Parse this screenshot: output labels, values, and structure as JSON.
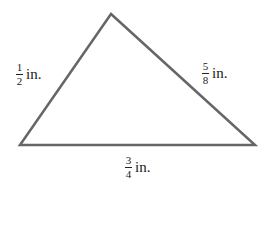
{
  "diagram": {
    "shape": "triangle",
    "vertices": [
      [
        111,
        14
      ],
      [
        20,
        145
      ],
      [
        255,
        145
      ]
    ],
    "stroke_color": "#666666",
    "sides": {
      "left": {
        "numerator": "1",
        "denominator": "2",
        "unit": "in."
      },
      "right": {
        "numerator": "5",
        "denominator": "8",
        "unit": "in."
      },
      "bottom": {
        "numerator": "3",
        "denominator": "4",
        "unit": "in."
      }
    }
  }
}
